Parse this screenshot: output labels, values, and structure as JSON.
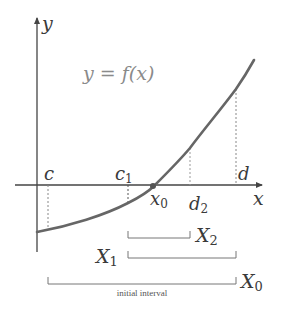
{
  "diagram": {
    "equation": "y = f(x)",
    "axes": {
      "x_label": "x",
      "y_label": "y"
    },
    "points": {
      "c": "c",
      "c1": "c",
      "c1_sub": "1",
      "x0": "x",
      "x0_sub": "0",
      "d2": "d",
      "d2_sub": "2",
      "d": "d"
    },
    "intervals": {
      "X2": "X",
      "X2_sub": "2",
      "X1": "X",
      "X1_sub": "1",
      "X0": "X",
      "X0_sub": "0",
      "caption": "initial interval"
    },
    "colors": {
      "curve": "#666666",
      "axis": "#444444",
      "dotted": "#888888",
      "bracket": "#777777",
      "root_point": "#555555"
    }
  }
}
